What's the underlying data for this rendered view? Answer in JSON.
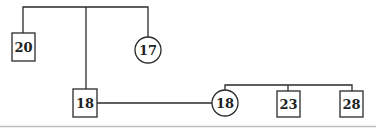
{
  "diagram": {
    "type": "pedigree",
    "generation1": {
      "male": {
        "shape": "square",
        "label": "20"
      },
      "female": {
        "shape": "circle",
        "label": "17"
      }
    },
    "generation2": {
      "male": {
        "shape": "square",
        "label": "18"
      },
      "female": {
        "shape": "circle",
        "label": "18"
      }
    },
    "generation3": [
      {
        "shape": "square",
        "label": "23"
      },
      {
        "shape": "square",
        "label": "28"
      }
    ]
  },
  "colors": {
    "line": "#2a2a2a",
    "base_line": "#bdbdbd",
    "background": "#ffffff"
  }
}
